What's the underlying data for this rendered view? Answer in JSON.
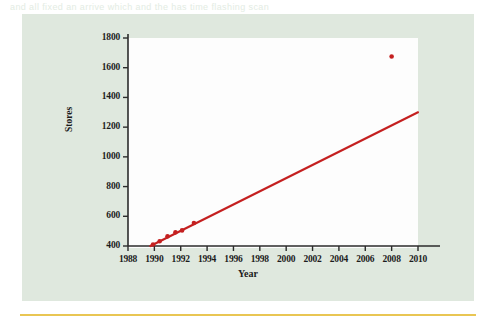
{
  "page": {
    "ghost_text": "and all fixed an arrive which and  the has  time flashing scan",
    "bottom_rule_color": "#e9c653",
    "panel_background": "#dfe8de",
    "plot_background": "#fdfdfd"
  },
  "chart_data": {
    "type": "scatter",
    "title": "",
    "xlabel": "Year",
    "ylabel": "Stores",
    "xlim": [
      1988,
      2010
    ],
    "ylim": [
      400,
      1800
    ],
    "grid": false,
    "legend": "none",
    "accent_color": "#c42020",
    "x_ticks": [
      1988,
      1990,
      1992,
      1994,
      1996,
      1998,
      2000,
      2002,
      2004,
      2006,
      2008,
      2010
    ],
    "x_tick_labels": [
      "1988",
      "1990",
      "1992",
      "1994",
      "1996",
      "1998",
      "2000",
      "2002",
      "2004",
      "2006",
      "2008",
      "2010"
    ],
    "y_ticks": [
      400,
      600,
      800,
      1000,
      1200,
      1400,
      1600,
      1800
    ],
    "y_tick_labels": [
      "400",
      "600",
      "800",
      "1000",
      "1200",
      "1400",
      "1600",
      "1800"
    ],
    "series": [
      {
        "name": "Stores",
        "marker": "circle",
        "color": "#c42020",
        "points": [
          {
            "x": 1989.9,
            "y": 410
          },
          {
            "x": 1990.4,
            "y": 432
          },
          {
            "x": 1991.0,
            "y": 465
          },
          {
            "x": 1991.6,
            "y": 492
          },
          {
            "x": 1992.1,
            "y": 505
          },
          {
            "x": 1993.0,
            "y": 555
          },
          {
            "x": 2008.0,
            "y": 1675
          }
        ]
      }
    ],
    "fit_line": {
      "name": "Least-squares regression line",
      "color": "#c42020",
      "x_start": 1989.7,
      "y_start": 400,
      "x_end": 2010.0,
      "y_end": 1300
    }
  }
}
